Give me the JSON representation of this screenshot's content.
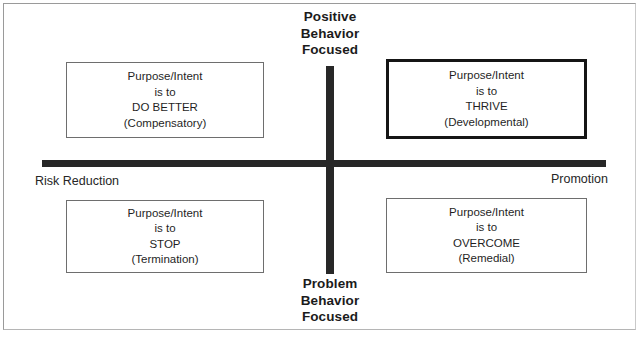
{
  "diagram": {
    "type": "quadrant",
    "poles": {
      "top": "Positive\nBehavior\nFocused",
      "top_line1": "Positive",
      "top_line2": "Behavior",
      "top_line3": "Focused",
      "bottom_line1": "Problem",
      "bottom_line2": "Behavior",
      "bottom_line3": "Focused",
      "left": "Risk Reduction",
      "right": "Promotion"
    },
    "axis_color": "#272727",
    "emphasis_border_color": "#151515",
    "quadrants": [
      {
        "id": "top-left",
        "position": "upper-left",
        "emphasis": false,
        "line1": "Purpose/Intent",
        "line2": "is to",
        "line3": "DO BETTER",
        "line4": "(Compensatory)"
      },
      {
        "id": "top-right",
        "position": "upper-right",
        "emphasis": true,
        "line1": "Purpose/Intent",
        "line2": "is to",
        "line3": "THRIVE",
        "line4": "(Developmental)"
      },
      {
        "id": "bottom-left",
        "position": "lower-left",
        "emphasis": false,
        "line1": "Purpose/Intent",
        "line2": "is to",
        "line3": "STOP",
        "line4": "(Termination)"
      },
      {
        "id": "bottom-right",
        "position": "lower-right",
        "emphasis": false,
        "line1": "Purpose/Intent",
        "line2": "is to",
        "line3": "OVERCOME",
        "line4": "(Remedial)"
      }
    ]
  }
}
